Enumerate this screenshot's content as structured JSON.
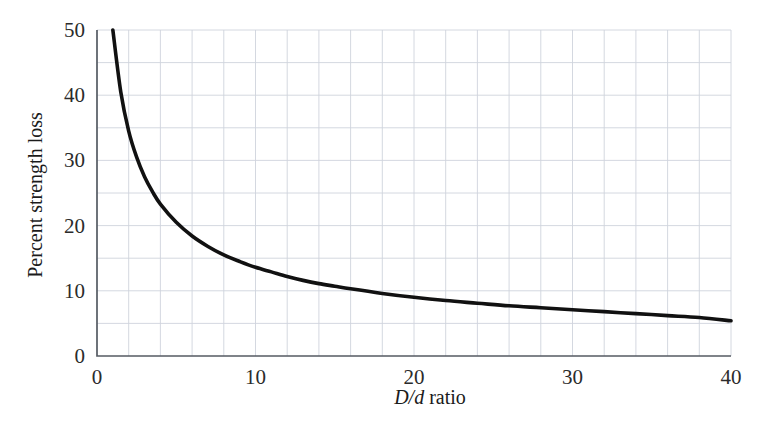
{
  "chart_data": {
    "type": "line",
    "title": "",
    "subtitle": "",
    "xlabel": "D/d ratio",
    "xlabel_italic_part": "D/d",
    "xlabel_roman_part": "ratio",
    "ylabel": "Percent strength loss",
    "xlim": [
      0,
      40
    ],
    "ylim": [
      0,
      50
    ],
    "x_tick_labels": [
      "0",
      "10",
      "20",
      "30",
      "40"
    ],
    "x_ticks": [
      0,
      10,
      20,
      30,
      40
    ],
    "y_tick_labels": [
      "0",
      "10",
      "20",
      "30",
      "40",
      "50"
    ],
    "y_ticks": [
      0,
      10,
      20,
      30,
      40,
      50
    ],
    "x_grid_step": 2,
    "y_grid_step": 5,
    "grid": true,
    "legend": null,
    "legend_position": "none",
    "series": [
      {
        "name": "Percent strength loss",
        "color": "#111111",
        "x": [
          1,
          1.5,
          2,
          2.5,
          3,
          3.5,
          4,
          5,
          6,
          7,
          8,
          9,
          10,
          11,
          12,
          13,
          14,
          15,
          16,
          18,
          20,
          22,
          24,
          26,
          28,
          30,
          32,
          34,
          36,
          38,
          40
        ],
        "values": [
          50.0,
          40.5,
          34.5,
          30.5,
          27.5,
          25.2,
          23.3,
          20.5,
          18.4,
          16.8,
          15.5,
          14.5,
          13.6,
          12.9,
          12.2,
          11.6,
          11.1,
          10.7,
          10.3,
          9.6,
          9.0,
          8.5,
          8.1,
          7.7,
          7.4,
          7.1,
          6.8,
          6.5,
          6.2,
          5.9,
          5.4
        ]
      }
    ],
    "annotations": [],
    "notable_points": [
      {
        "x": 1,
        "y": 50
      },
      {
        "x": 10,
        "y": 13.6
      },
      {
        "x": 20,
        "y": 9.0
      },
      {
        "x": 30,
        "y": 7.1
      },
      {
        "x": 40,
        "y": 5.4
      }
    ]
  },
  "colors": {
    "curve": "#111111",
    "grid": "#cfd4dc",
    "axis": "#555b63",
    "text": "#1b1b1b",
    "background": "#ffffff"
  }
}
